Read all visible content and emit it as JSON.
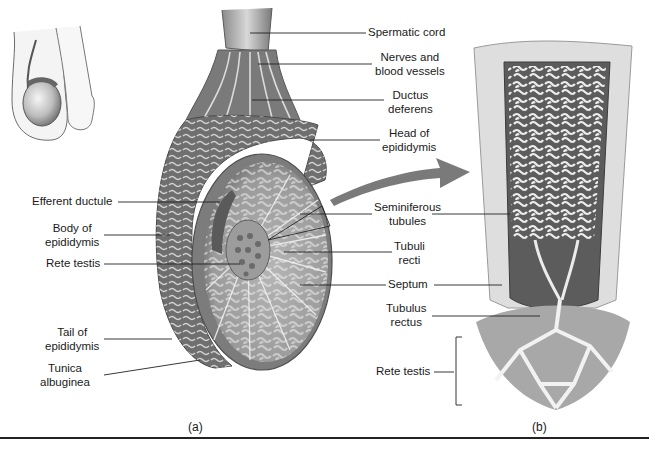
{
  "figure": {
    "panels": [
      {
        "id": "a",
        "caption": "(a)"
      },
      {
        "id": "b",
        "caption": "(b)"
      }
    ],
    "labels_a_right": [
      {
        "id": "spermatic-cord",
        "lines": [
          "Spermatic cord"
        ]
      },
      {
        "id": "nerves-blood-vessels",
        "lines": [
          "Nerves and",
          "blood vessels"
        ]
      },
      {
        "id": "ductus-deferens",
        "lines": [
          "Ductus",
          "deferens"
        ]
      },
      {
        "id": "head-of-epididymis",
        "lines": [
          "Head of",
          "epididymis"
        ]
      }
    ],
    "labels_a_left": [
      {
        "id": "efferent-ductule",
        "lines": [
          "Efferent ductule"
        ]
      },
      {
        "id": "body-of-epididymis",
        "lines": [
          "Body of",
          "epididymis"
        ]
      },
      {
        "id": "rete-testis-a",
        "lines": [
          "Rete testis"
        ]
      },
      {
        "id": "tail-of-epididymis",
        "lines": [
          "Tail of",
          "epididymis"
        ]
      },
      {
        "id": "tunica-albuginea",
        "lines": [
          "Tunica",
          "albuginea"
        ]
      }
    ],
    "labels_middle": [
      {
        "id": "seminiferous-tubules",
        "lines": [
          "Seminiferous",
          "tubules"
        ]
      },
      {
        "id": "tubuli-recti",
        "lines": [
          "Tubuli",
          "recti"
        ]
      },
      {
        "id": "septum",
        "lines": [
          "Septum"
        ]
      },
      {
        "id": "tubulus-rectus",
        "lines": [
          "Tubulus",
          "rectus"
        ]
      },
      {
        "id": "rete-testis-b",
        "lines": [
          "Rete testis"
        ]
      }
    ],
    "colors": {
      "tissue_dark": "#5e5e5e",
      "tissue_mid": "#8a8a8a",
      "tissue_light": "#c9c9c9",
      "tubule": "#e8e8e8",
      "arrow": "#7a7a7a",
      "line": "#222222"
    }
  }
}
